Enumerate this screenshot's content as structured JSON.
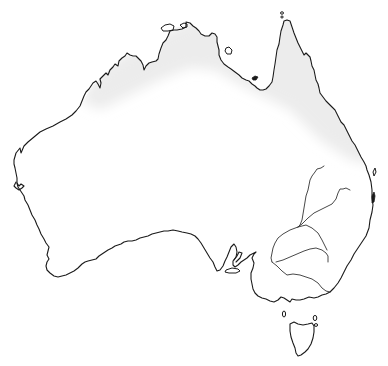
{
  "map": {
    "subject": "Australia outline map",
    "regions": [
      {
        "id": "mainland",
        "label": "Australian mainland"
      },
      {
        "id": "tasmania",
        "label": "Tasmania"
      }
    ],
    "shaded_zone": {
      "label": "Northern tropical band",
      "color": "#ececec"
    },
    "features": {
      "rivers": [
        "Darling tributary north",
        "Darling tributary east",
        "Murrumbidgee",
        "Murray"
      ],
      "islands": [
        "Melville Island",
        "Groote Eylandt",
        "Mornington Island",
        "Torres Strait islet",
        "Fraser Island",
        "Kangaroo Island",
        "King Island",
        "Flinders Island"
      ]
    },
    "colors": {
      "background": "#ffffff",
      "coastline": "#1a1a1a",
      "river": "#333333",
      "shading": "#ececec"
    }
  }
}
